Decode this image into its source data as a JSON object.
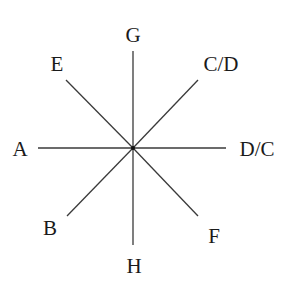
{
  "diagram": {
    "center": {
      "x": 133,
      "y": 148
    },
    "line_color": "#3a3a3a",
    "rays": [
      {
        "id": "A",
        "label": "A",
        "x2": 38,
        "y2": 148,
        "lx": 20,
        "ly": 156
      },
      {
        "id": "DC",
        "label": "D/C",
        "x2": 226,
        "y2": 148,
        "lx": 257,
        "ly": 156
      },
      {
        "id": "G",
        "label": "G",
        "x2": 133,
        "y2": 51,
        "lx": 133,
        "ly": 42
      },
      {
        "id": "H",
        "label": "H",
        "x2": 133,
        "y2": 245,
        "lx": 134,
        "ly": 273
      },
      {
        "id": "E",
        "label": "E",
        "x2": 66,
        "y2": 80,
        "lx": 57,
        "ly": 71
      },
      {
        "id": "CD",
        "label": "C/D",
        "x2": 198,
        "y2": 80,
        "lx": 221,
        "ly": 71
      },
      {
        "id": "B",
        "label": "B",
        "x2": 67,
        "y2": 216,
        "lx": 50,
        "ly": 235
      },
      {
        "id": "F",
        "label": "F",
        "x2": 198,
        "y2": 216,
        "lx": 214,
        "ly": 243
      }
    ]
  }
}
